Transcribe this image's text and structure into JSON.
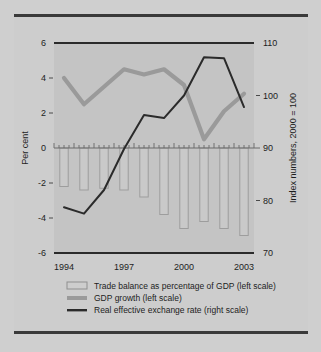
{
  "figure": {
    "background_color": "#cfcfcf",
    "plot_background_color": "#c3c3c3",
    "rule_color": "#3a3a3a"
  },
  "axes": {
    "left_title": "Per cent",
    "right_title": "Index numbers, 2000 = 100",
    "left_ticks": [
      "6",
      "4",
      "2",
      "0",
      "-2",
      "-4",
      "-6"
    ],
    "right_ticks": [
      "110",
      "100",
      "90",
      "80",
      "70"
    ],
    "x_ticks": [
      "1994",
      "1997",
      "2000",
      "2003"
    ]
  },
  "legend": {
    "items": [
      {
        "label": "Trade balance as percentage of GDP (left scale)",
        "marker": "hollow-bar-swatch",
        "color": "#c9c9c9"
      },
      {
        "label": "GDP growth (left scale)",
        "marker": "thick-gray-line-swatch",
        "color": "#9a9a9a"
      },
      {
        "label": "Real effective exchange rate (right scale)",
        "marker": "thin-dark-line-swatch",
        "color": "#2b2b2b"
      }
    ]
  },
  "chart_data": {
    "type": "bar",
    "title": "",
    "subtitle": "",
    "xlabel": "",
    "ylabel": "Per cent",
    "y2label": "Index numbers, 2000 = 100",
    "grid": false,
    "legend_position": "bottom",
    "x": [
      1994,
      1995,
      1996,
      1997,
      1998,
      1999,
      2000,
      2001,
      2002,
      2003
    ],
    "xlim": [
      1993.5,
      2003.5
    ],
    "ylim": [
      -6,
      6
    ],
    "y2lim": [
      70,
      110
    ],
    "xtick_values": [
      1994,
      1997,
      2000,
      2003
    ],
    "ytick_values": [
      6,
      4,
      2,
      0,
      -2,
      -4,
      -6
    ],
    "y2tick_values": [
      110,
      100,
      90,
      80,
      70
    ],
    "series": [
      {
        "name": "Trade balance as percentage of GDP (left scale)",
        "type": "bar",
        "axis": "left",
        "color": "#c9c9c9",
        "edge_color": "#9d9d9d",
        "values": [
          -2.2,
          -2.4,
          -2.3,
          -2.4,
          -2.8,
          -3.8,
          -4.6,
          -4.2,
          -4.6,
          -5.0
        ]
      },
      {
        "name": "GDP growth (left scale)",
        "type": "line",
        "axis": "left",
        "color": "#9a9a9a",
        "values": [
          4.0,
          2.5,
          3.5,
          4.5,
          4.2,
          4.5,
          3.6,
          0.5,
          2.1,
          3.1
        ]
      },
      {
        "name": "Real effective exchange rate (right scale)",
        "type": "line",
        "axis": "right",
        "color": "#2b2b2b",
        "values": [
          78.7,
          77.5,
          82.0,
          89.8,
          96.3,
          95.7,
          100.0,
          107.3,
          107.1,
          97.8
        ]
      }
    ]
  }
}
